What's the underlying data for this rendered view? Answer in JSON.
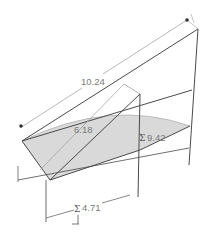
{
  "sketch": {
    "dimensions": [
      {
        "id": "dim-top",
        "label": "10.24"
      },
      {
        "id": "dim-mid",
        "label": "6.18"
      },
      {
        "id": "dim-right",
        "label": "9.42",
        "symbol": "Σ"
      },
      {
        "id": "dim-bottom",
        "label": "4.71",
        "symbol": "Σ"
      }
    ],
    "colors": {
      "line": "#4a4a4a",
      "dim_line": "#8c8c8c",
      "fill": "#d9d9d9",
      "text": "#7a7a7a"
    }
  }
}
